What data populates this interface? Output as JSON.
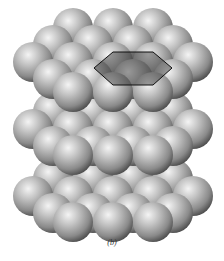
{
  "figure": {
    "caption": "(b)",
    "colors": {
      "background": "#ffffff",
      "sphere_highlight": "#f2f2f2",
      "sphere_mid": "#a8a8a8",
      "sphere_shadow": "#4a4a4a",
      "hexagon_fill": "#2a2a2a",
      "hexagon_stroke": "#111111"
    },
    "sphere_radius": 20,
    "layers": [
      {
        "name": "bottom-layer",
        "spheres": [
          [
            73,
            162
          ],
          [
            113,
            162
          ],
          [
            153,
            162
          ],
          [
            53,
            179
          ],
          [
            93,
            179
          ],
          [
            133,
            179
          ],
          [
            173,
            179
          ],
          [
            33,
            196
          ],
          [
            73,
            196
          ],
          [
            113,
            196
          ],
          [
            153,
            196
          ],
          [
            193,
            196
          ],
          [
            53,
            213
          ],
          [
            93,
            213
          ],
          [
            133,
            213
          ],
          [
            173,
            213
          ],
          [
            73,
            222
          ],
          [
            113,
            222
          ],
          [
            153,
            222
          ]
        ]
      },
      {
        "name": "middle-layer",
        "spheres": [
          [
            73,
            95
          ],
          [
            113,
            95
          ],
          [
            153,
            95
          ],
          [
            53,
            112
          ],
          [
            93,
            112
          ],
          [
            133,
            112
          ],
          [
            173,
            112
          ],
          [
            33,
            129
          ],
          [
            73,
            129
          ],
          [
            113,
            129
          ],
          [
            153,
            129
          ],
          [
            193,
            129
          ],
          [
            53,
            146
          ],
          [
            93,
            146
          ],
          [
            133,
            146
          ],
          [
            173,
            146
          ],
          [
            73,
            155
          ],
          [
            113,
            155
          ],
          [
            153,
            155
          ]
        ]
      },
      {
        "name": "top-layer",
        "spheres": [
          [
            73,
            28
          ],
          [
            113,
            28
          ],
          [
            153,
            28
          ],
          [
            53,
            45
          ],
          [
            93,
            45
          ],
          [
            133,
            45
          ],
          [
            173,
            45
          ],
          [
            33,
            62
          ],
          [
            73,
            62
          ],
          [
            113,
            62
          ],
          [
            153,
            62
          ],
          [
            193,
            62
          ],
          [
            53,
            79
          ],
          [
            93,
            79
          ],
          [
            133,
            79
          ],
          [
            173,
            79
          ],
          [
            73,
            92
          ],
          [
            113,
            92
          ],
          [
            153,
            92
          ]
        ]
      }
    ],
    "hexagon": {
      "points": [
        [
          113,
          52
        ],
        [
          153,
          52
        ],
        [
          172,
          68
        ],
        [
          153,
          85
        ],
        [
          113,
          85
        ],
        [
          94,
          68
        ]
      ]
    }
  }
}
